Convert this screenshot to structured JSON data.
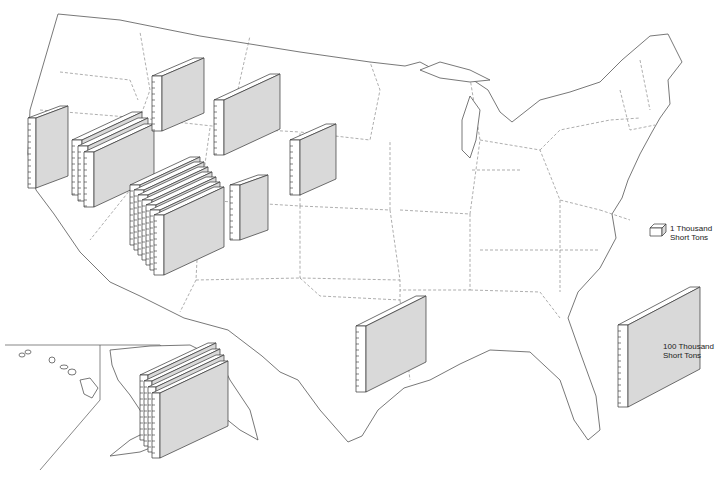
{
  "legend": {
    "small_unit_label_line1": "1 Thousand",
    "small_unit_label_line2": "Short Tons",
    "large_unit_label_line1": "100 Thousand",
    "large_unit_label_line2": "Short Tons"
  },
  "colors": {
    "block_face": "#d9d9d9",
    "block_edge": "#333333",
    "map_outline": "#555555",
    "background": "#ffffff"
  },
  "symbols": [
    {
      "region": "california-north",
      "block_count": 1
    },
    {
      "region": "oregon-nevada",
      "block_count": 3
    },
    {
      "region": "idaho",
      "block_count": 1
    },
    {
      "region": "montana",
      "block_count": 1
    },
    {
      "region": "wyoming-south-dakota",
      "block_count": 1
    },
    {
      "region": "nevada-utah",
      "block_count": 7
    },
    {
      "region": "utah-colorado",
      "block_count": 1
    },
    {
      "region": "texas-louisiana",
      "block_count": 1
    },
    {
      "region": "alaska",
      "block_count": 4
    }
  ]
}
